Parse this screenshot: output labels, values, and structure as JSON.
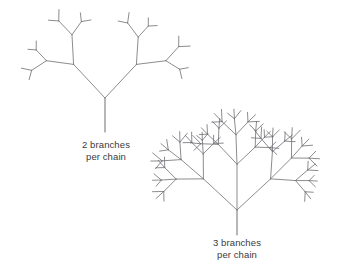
{
  "figure": {
    "name": "branching-chain-diagram",
    "background_color": "#ffffff",
    "stroke_color": "#6e6e73",
    "text_color": "#3a3a3c",
    "width": 353,
    "height": 266
  },
  "captions": {
    "left": {
      "line1": "2 branches",
      "line2": "per chain"
    },
    "right": {
      "line1": "3 branches",
      "line2": "per chain"
    }
  },
  "chart_data": {
    "type": "diagram",
    "title": "",
    "trees": [
      {
        "id": "tree-left",
        "label_line1": "2 branches",
        "label_line2": "per chain",
        "branches_per_chain": 2,
        "root": {
          "x": 105,
          "y": 132
        },
        "junction": {
          "x": 105,
          "y": 98
        },
        "trunk_length": 34,
        "depth_levels": 4,
        "spread_deg": 42,
        "bounds": {
          "x": 6,
          "y": 4,
          "width": 206,
          "height": 128
        }
      },
      {
        "id": "tree-right",
        "label_line1": "3 branches",
        "label_line2": "per chain",
        "branches_per_chain": 3,
        "root": {
          "x": 237,
          "y": 235
        },
        "junction": {
          "x": 237,
          "y": 210
        },
        "trunk_length": 25,
        "depth_levels": 4,
        "spread_deg": 46,
        "bounds": {
          "x": 146,
          "y": 104,
          "width": 205,
          "height": 131
        }
      }
    ]
  }
}
